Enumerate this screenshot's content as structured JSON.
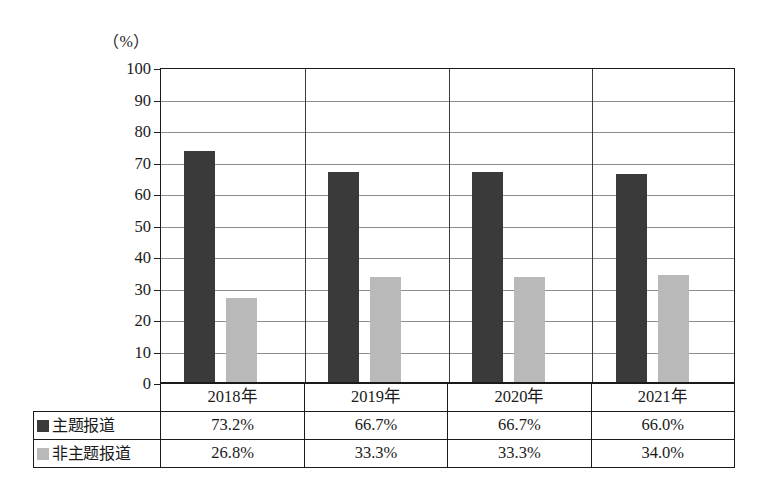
{
  "chart_data": {
    "type": "bar",
    "title": "",
    "subtitle": "",
    "xlabel": "",
    "ylabel": "",
    "unit_label": "（%）",
    "categories": [
      "2018年",
      "2019年",
      "2020年",
      "2021年"
    ],
    "series": [
      {
        "name": "主题报道",
        "color": "#3a3a3a",
        "values": [
          73.2,
          66.7,
          66.7,
          66.0
        ],
        "labels": [
          "73.2%",
          "66.7%",
          "66.7%",
          "66.0%"
        ]
      },
      {
        "name": "非主题报道",
        "color": "#b9b9b9",
        "values": [
          26.8,
          33.3,
          33.3,
          34.0
        ],
        "labels": [
          "26.8%",
          "33.3%",
          "33.3%",
          "34.0%"
        ]
      }
    ],
    "ylim": [
      0,
      100
    ],
    "ytick_step": 10,
    "yticks": [
      0,
      10,
      20,
      30,
      40,
      50,
      60,
      70,
      80,
      90,
      100
    ],
    "ytick_labels": [
      "0",
      "10",
      "20",
      "30",
      "40",
      "50",
      "60",
      "70",
      "80",
      "90",
      "100"
    ],
    "grid": true,
    "grid_axis": "y",
    "legend_position": "table-row-headers"
  },
  "table": {
    "corner_label": "",
    "column_headers": [
      "2018年",
      "2019年",
      "2020年",
      "2021年"
    ],
    "rows": [
      {
        "label": "主题报道",
        "swatch_color": "#3a3a3a",
        "values": [
          "73.2%",
          "66.7%",
          "66.7%",
          "66.0%"
        ]
      },
      {
        "label": "非主题报道",
        "swatch_color": "#b9b9b9",
        "values": [
          "26.8%",
          "33.3%",
          "33.3%",
          "34.0%"
        ]
      }
    ]
  }
}
